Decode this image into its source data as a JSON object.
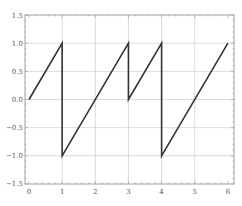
{
  "chart_data": {
    "type": "line",
    "title": "",
    "xlabel": "",
    "ylabel": "",
    "xlim": [
      -0.1,
      6.1
    ],
    "ylim": [
      -1.5,
      1.5
    ],
    "grid": true,
    "legend": null,
    "x_ticks": [
      "0",
      "1",
      "2",
      "3",
      "4",
      "5",
      "6"
    ],
    "y_ticks": [
      "1.5",
      "1.0",
      "0.5",
      "0.0",
      "-0.5",
      "-1.0",
      "-1.5"
    ],
    "series": [
      {
        "name": "sawtooth",
        "color": "#333333",
        "points": [
          [
            0,
            0
          ],
          [
            1,
            1
          ],
          [
            1,
            -1
          ],
          [
            3,
            1
          ],
          [
            3,
            0
          ],
          [
            4,
            1
          ],
          [
            4,
            -1
          ],
          [
            6,
            1
          ]
        ]
      }
    ]
  }
}
